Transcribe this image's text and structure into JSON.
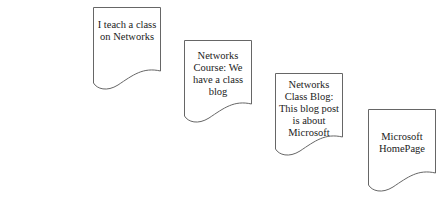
{
  "diagram": {
    "documents": [
      {
        "label": "I teach a class on Networks"
      },
      {
        "label": "Networks Course: We have a class blog"
      },
      {
        "label": "Networks Class Blog: This blog post is about Microsoft"
      },
      {
        "label": "Microsoft HomePage"
      }
    ]
  },
  "colors": {
    "stroke": "#666666",
    "text": "#222222",
    "background": "#ffffff"
  }
}
